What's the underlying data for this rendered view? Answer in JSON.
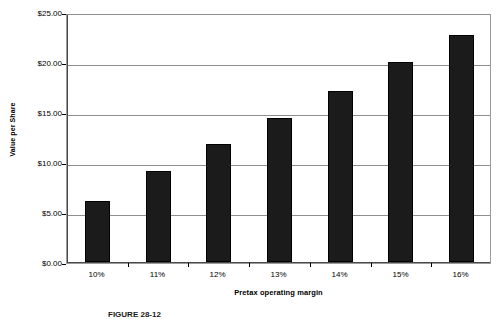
{
  "chart_data": {
    "type": "bar",
    "title": "",
    "categories": [
      "10%",
      "11%",
      "12%",
      "13%",
      "14%",
      "15%",
      "16%"
    ],
    "values": [
      6.1,
      9.1,
      11.8,
      14.4,
      17.1,
      20.0,
      22.7
    ],
    "series": [
      {
        "name": "Value per Share",
        "values": [
          6.1,
          9.1,
          11.8,
          14.4,
          17.1,
          20.0,
          22.7
        ]
      }
    ],
    "xlabel": "Pretax operating margin",
    "ylabel": "Value per Share",
    "ylim": [
      0,
      25
    ],
    "ytick_values": [
      0,
      5,
      10,
      15,
      20,
      25
    ],
    "ytick_labels": [
      "$0.00",
      "$5.00",
      "$10.00",
      "$15.00",
      "$20.00",
      "$25.00"
    ],
    "ytick_step": 5,
    "grid": true,
    "grid_axis": "y",
    "legend": false,
    "legend_position": "none",
    "bar_color": "#1b1b1b",
    "grid_color": "#8e8e8e",
    "frame_color": "#9a9a9a",
    "background_color": "#ffffff"
  },
  "axes": {
    "y_title": "Value per Share",
    "x_title": "Pretax operating margin"
  },
  "caption": {
    "text": "FIGURE 28-12"
  }
}
